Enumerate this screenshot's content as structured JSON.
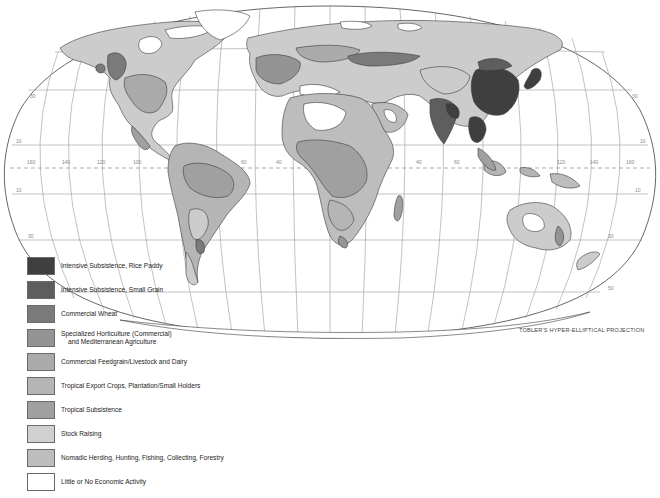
{
  "map": {
    "projection_label": "TOBLER'S HYPER-ELLIPTICAL PROJECTION",
    "longitude_labels": [
      "160",
      "140",
      "120",
      "100",
      "80",
      "60",
      "40",
      "20",
      "0",
      "20",
      "40",
      "60",
      "80",
      "100",
      "120",
      "140",
      "160",
      "180"
    ],
    "latitude_labels": [
      "30",
      "10",
      "10",
      "30",
      "50"
    ],
    "colors": {
      "rice_paddy": "#3f3f3f",
      "small_grain": "#5e5e5e",
      "commercial_wheat": "#7a7a7a",
      "horticulture": "#949494",
      "feedgrain": "#aaaaaa",
      "tropical_export": "#b5b5b5",
      "tropical_subsistence": "#a0a0a0",
      "stock_raising": "#cccccc",
      "nomadic": "#bdbdbd",
      "little_none": "#ffffff"
    }
  },
  "legend": {
    "items": [
      {
        "label": "Intensive Subsistence, Rice Paddy",
        "color": "#3f3f3f"
      },
      {
        "label": "Intensive Subsistence, Small Grain",
        "color": "#5e5e5e"
      },
      {
        "label": "Commercial Wheat",
        "color": "#7a7a7a"
      },
      {
        "label": "Specialized Horticulture (Commercial)",
        "label_line2": "and Mediterranean Agriculture",
        "color": "#949494"
      },
      {
        "label": "Commercial Feedgrain/Livestock and Dairy",
        "color": "#aaaaaa"
      },
      {
        "label": "Tropical Export Crops, Plantation/Small Holders",
        "color": "#b5b5b5"
      },
      {
        "label": "Tropical Subsistence",
        "color": "#a0a0a0"
      },
      {
        "label": "Stock Raising",
        "color": "#d0d0d0"
      },
      {
        "label": "Nomadic Herding, Hunting, Fishing, Collecting, Forestry",
        "color": "#bdbdbd"
      },
      {
        "label": "Little or No Economic Activity",
        "color": "#ffffff"
      }
    ]
  }
}
